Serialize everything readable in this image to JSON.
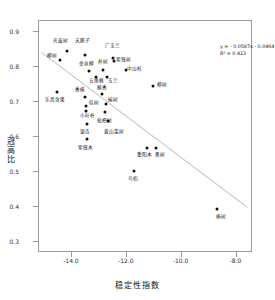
{
  "chart_data": {
    "type": "scatter",
    "title": "",
    "xlabel": "稳定性指数",
    "ylabel": "冠高比",
    "xlim": [
      -15.2,
      -7.4
    ],
    "ylim": [
      0.27,
      0.93
    ],
    "xticks": [
      "-14.0",
      "-12.0",
      "-10.0",
      "-8.0"
    ],
    "xtick_values": [
      -14.0,
      -12.0,
      -10.0,
      -8.0
    ],
    "yticks": [
      "0.3",
      "0.4",
      "0.5",
      "0.6",
      "0.7",
      "0.8",
      "0.9"
    ],
    "ytick_values": [
      0.3,
      0.4,
      0.5,
      0.6,
      0.7,
      0.8,
      0.9
    ],
    "grid": false,
    "legend": "none",
    "equation": "y = - 0.0587x - 0.0464",
    "r_squared": "R² = 0.413",
    "trendline": {
      "slope": -0.0587,
      "intercept": -0.0464,
      "x_start": -15.1,
      "x_end": -7.6,
      "color": "#b8b8b8"
    },
    "point_color": "#111111",
    "points": [
      {
        "label": "光皮树",
        "x": -14.18,
        "y": 0.845,
        "lx": -14.4,
        "ly": 0.872
      },
      {
        "label": "柳树",
        "x": -14.45,
        "y": 0.82,
        "lx": -14.72,
        "ly": 0.83
      },
      {
        "label": "天鹅子",
        "x": -13.52,
        "y": 0.833,
        "lx": -13.6,
        "ly": 0.872
      },
      {
        "label": "广玉兰",
        "x": -12.5,
        "y": 0.825,
        "lx": -12.52,
        "ly": 0.858
      },
      {
        "label": "紫薇树",
        "x": -12.46,
        "y": 0.817,
        "lx": -12.12,
        "ly": 0.818
      },
      {
        "label": "朴树",
        "x": -12.87,
        "y": 0.791,
        "lx": -12.85,
        "ly": 0.812
      },
      {
        "label": "金丝柳",
        "x": -13.38,
        "y": 0.787,
        "lx": -13.48,
        "ly": 0.807
      },
      {
        "label": "中山杉",
        "x": -12.02,
        "y": 0.791,
        "lx": -11.72,
        "ly": 0.793
      },
      {
        "label": "五角枫",
        "x": -13.14,
        "y": 0.772,
        "lx": -13.12,
        "ly": 0.76
      },
      {
        "label": "玉兰",
        "x": -12.72,
        "y": 0.77,
        "lx": -12.5,
        "ly": 0.76
      },
      {
        "label": "柳树2",
        "x": -11.06,
        "y": 0.745,
        "lx": -10.72,
        "ly": 0.748
      },
      {
        "label": "乐昌含笑",
        "x": -14.55,
        "y": 0.728,
        "lx": -14.62,
        "ly": 0.706
      },
      {
        "label": "香樟",
        "x": -13.52,
        "y": 0.715,
        "lx": -13.7,
        "ly": 0.733
      },
      {
        "label": "枫香",
        "x": -12.92,
        "y": 0.722,
        "lx": -12.92,
        "ly": 0.74
      },
      {
        "label": "桂树",
        "x": -13.5,
        "y": 0.687,
        "lx": -13.2,
        "ly": 0.696
      },
      {
        "label": "榆树",
        "x": -12.76,
        "y": 0.693,
        "lx": -12.52,
        "ly": 0.706
      },
      {
        "label": "小叶朴",
        "x": -13.48,
        "y": 0.675,
        "lx": -13.45,
        "ly": 0.66
      },
      {
        "label": "枇杷树",
        "x": -12.8,
        "y": 0.672,
        "lx": -12.8,
        "ly": 0.645
      },
      {
        "label": "银杏",
        "x": -13.44,
        "y": 0.637,
        "lx": -13.52,
        "ly": 0.614
      },
      {
        "label": "黄山栾树",
        "x": -12.7,
        "y": 0.645,
        "lx": -12.46,
        "ly": 0.615
      },
      {
        "label": "紫薇木",
        "x": -13.45,
        "y": 0.593,
        "lx": -13.52,
        "ly": 0.57
      },
      {
        "label": "重阳木",
        "x": -11.26,
        "y": 0.57,
        "lx": -11.34,
        "ly": 0.548
      },
      {
        "label": "桑树",
        "x": -10.92,
        "y": 0.57,
        "lx": -10.8,
        "ly": 0.548
      },
      {
        "label": "乌桕",
        "x": -11.72,
        "y": 0.504,
        "lx": -11.76,
        "ly": 0.481
      },
      {
        "label": "杨树",
        "x": -8.72,
        "y": 0.394,
        "lx": -8.58,
        "ly": 0.372
      }
    ]
  }
}
